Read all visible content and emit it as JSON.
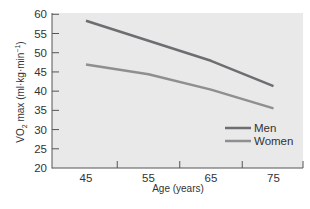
{
  "chart_data": {
    "type": "line",
    "title": "",
    "xlabel": "Age (years)",
    "ylabel": "VO2 max (ml·kg·min⁻¹)",
    "ylabel_parts": {
      "main": "VO",
      "sub": "2",
      "rest": " max (ml·kg·min",
      "sup": "−1",
      "close": ")"
    },
    "x": [
      45,
      55,
      65,
      75
    ],
    "x_ticks": [
      "45",
      "55",
      "65",
      "75"
    ],
    "y_ticks": [
      "20",
      "25",
      "30",
      "35",
      "40",
      "45",
      "50",
      "55",
      "60"
    ],
    "ylim": [
      20,
      60
    ],
    "xlim": [
      40,
      80
    ],
    "grid": false,
    "legend_position": "lower right (inside plot)",
    "series": [
      {
        "name": "Men",
        "values": [
          58.3,
          53.1,
          47.9,
          41.3
        ],
        "color": "#6e6e72"
      },
      {
        "name": "Women",
        "values": [
          46.9,
          44.4,
          40.4,
          35.5
        ],
        "color": "#8f8f92"
      }
    ],
    "plot_background": "#e9e9e9"
  }
}
